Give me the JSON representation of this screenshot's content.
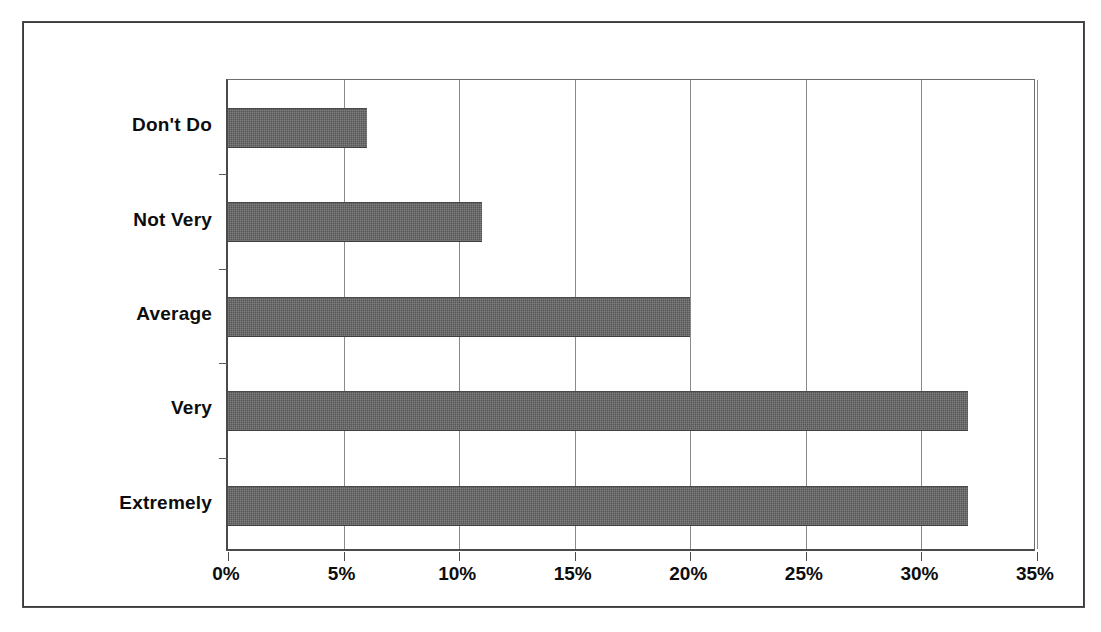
{
  "chart_data": {
    "type": "bar",
    "orientation": "horizontal",
    "title": "",
    "subtitle": "",
    "xlabel": "",
    "ylabel": "",
    "categories": [
      "Don't Do",
      "Not Very",
      "Average",
      "Very",
      "Extremely"
    ],
    "values": [
      6,
      11,
      20,
      32,
      32
    ],
    "series": [
      {
        "name": "",
        "values": [
          6,
          11,
          20,
          32,
          32
        ]
      }
    ],
    "xlim": [
      0,
      35
    ],
    "xticks": [
      0,
      5,
      10,
      15,
      20,
      25,
      30,
      35
    ],
    "xtick_labels": [
      "0%",
      "5%",
      "10%",
      "15%",
      "20%",
      "25%",
      "30%",
      "35%"
    ],
    "grid": "vertical",
    "gridlines_at": [
      5,
      10,
      15,
      20,
      25,
      30,
      35
    ],
    "legend": "none",
    "bar_color": "#555555",
    "axis_color": "#4a4a4a",
    "gridline_color": "#8a8a8a",
    "background_color": "#ffffff",
    "frame_color": "#3a3a3a",
    "units": "percent"
  },
  "bars": [
    {
      "label": "Don't Do",
      "value": 6,
      "value_label": "6%"
    },
    {
      "label": "Not Very",
      "value": 11,
      "value_label": "11%"
    },
    {
      "label": "Average",
      "value": 20,
      "value_label": "20%"
    },
    {
      "label": "Very",
      "value": 32,
      "value_label": "32%"
    },
    {
      "label": "Extremely",
      "value": 32,
      "value_label": "32%"
    }
  ],
  "xaxis": {
    "ticks": [
      {
        "value": 0,
        "label": "0%"
      },
      {
        "value": 5,
        "label": "5%"
      },
      {
        "value": 10,
        "label": "10%"
      },
      {
        "value": 15,
        "label": "15%"
      },
      {
        "value": 20,
        "label": "20%"
      },
      {
        "value": 25,
        "label": "25%"
      },
      {
        "value": 30,
        "label": "30%"
      },
      {
        "value": 35,
        "label": "35%"
      }
    ]
  }
}
